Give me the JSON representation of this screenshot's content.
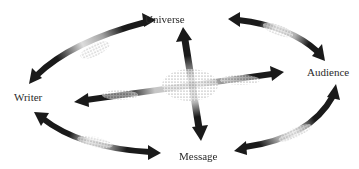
{
  "diagram": {
    "type": "communication-triangle-ellipse",
    "nodes": [
      {
        "id": "universe",
        "label": "Universe",
        "x": 145,
        "y": 14
      },
      {
        "id": "audience",
        "label": "Audience",
        "x": 307,
        "y": 67
      },
      {
        "id": "writer",
        "label": "Writer",
        "x": 14,
        "y": 92
      },
      {
        "id": "message",
        "label": "Message",
        "x": 179,
        "y": 151
      }
    ],
    "edges": [
      {
        "from": "writer",
        "to": "universe",
        "style": "double-headed-stippled",
        "position": "outer-top-left"
      },
      {
        "from": "universe",
        "to": "audience",
        "style": "double-headed-stippled",
        "position": "outer-top-right"
      },
      {
        "from": "audience",
        "to": "message",
        "style": "double-headed-stippled",
        "position": "outer-bottom-right"
      },
      {
        "from": "message",
        "to": "writer",
        "style": "double-headed-stippled",
        "position": "outer-bottom-left"
      },
      {
        "from": "universe",
        "to": "message",
        "style": "double-headed-stippled",
        "position": "inner-vertical"
      },
      {
        "from": "writer",
        "to": "audience",
        "style": "double-headed-stippled",
        "position": "inner-horizontal"
      }
    ],
    "colors": {
      "ink": "#1a1a1a",
      "background": "#ffffff",
      "label": "#2a2a2a"
    }
  }
}
